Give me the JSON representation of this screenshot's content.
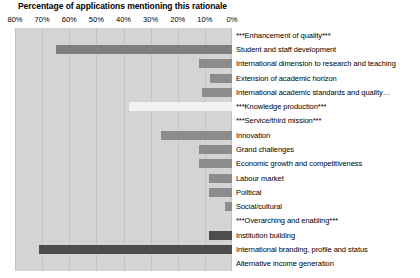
{
  "chart_data": {
    "type": "bar",
    "orientation": "horizontal",
    "title": "Percentage of applications mentioning this rationale",
    "xlabel": "",
    "ylabel": "",
    "xlim": [
      80,
      0
    ],
    "x_reversed": true,
    "xticks": [
      "80%",
      "70%",
      "60%",
      "50%",
      "40%",
      "30%",
      "20%",
      "10%",
      "0%"
    ],
    "xtick_values": [
      80,
      70,
      60,
      50,
      40,
      30,
      20,
      10,
      0
    ],
    "grid": true,
    "legend": "none",
    "plot_background": "#d4d4d4",
    "categories": [
      "***Enhancement of quality***",
      "Student and staff development",
      "International dimension to research and teaching",
      "Extension of academic horizon",
      "International academic standards and quality…",
      "***Knowledge production***",
      "***Service/third mission***",
      "Innovation",
      "Grand challenges",
      "Economic growth and competitiveness",
      "Labour market",
      "Political",
      "Social/cultural",
      "***Overarching and enabling***",
      "Institution building",
      "International branding, profile and status",
      "Alternative income generation"
    ],
    "values": [
      0,
      65,
      12,
      8,
      11,
      38,
      0,
      26,
      12,
      12,
      8.5,
      8.5,
      2.5,
      0,
      8.5,
      71,
      0
    ],
    "bar_colors": [
      "none",
      "#7f7f7f",
      "#8c8c8c",
      "#8c8c8c",
      "#8c8c8c",
      "#f2f2f2",
      "none",
      "#8c8c8c",
      "#8c8c8c",
      "#8c8c8c",
      "#8c8c8c",
      "#8c8c8c",
      "#8c8c8c",
      "none",
      "#4d4d4d",
      "#4d4d4d",
      "none"
    ],
    "header_rows": [
      0,
      5,
      6,
      13
    ]
  }
}
